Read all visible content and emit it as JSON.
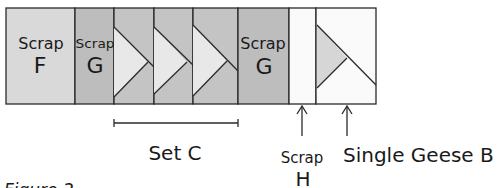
{
  "diagram": {
    "title": "Figure 2",
    "colors": {
      "scrap_f": "#d9d9d9",
      "scrap_g": "#bdbdbd",
      "geese_bg": "#c4c4c4",
      "geese_triangle": "#e8e8e8",
      "scrap_h": "#fafafa",
      "single_geese_bg": "#fafafa",
      "single_geese_triangle": "#d6d6d6",
      "stroke": "#2a2a2a"
    },
    "blocks": [
      {
        "id": "scrap-f",
        "line1": "Scrap",
        "line2": "F"
      },
      {
        "id": "scrap-g-1",
        "line1": "Scrap",
        "line2": "G"
      },
      {
        "id": "geese-1",
        "type": "flying-geese"
      },
      {
        "id": "geese-2",
        "type": "flying-geese"
      },
      {
        "id": "geese-3",
        "type": "flying-geese"
      },
      {
        "id": "scrap-g-2",
        "line1": "Scrap",
        "line2": "G"
      },
      {
        "id": "scrap-h",
        "line1": "",
        "line2": ""
      },
      {
        "id": "single-geese-b",
        "type": "single-geese"
      }
    ],
    "annotations": {
      "set_c": "Set C",
      "scrap_h_line1": "Scrap",
      "scrap_h_line2": "H",
      "single_geese_b": "Single Geese B"
    }
  }
}
